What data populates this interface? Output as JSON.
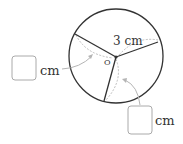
{
  "diagram": {
    "radius_label": "3 cm",
    "center_label": "O",
    "answer_boxes": [
      {
        "unit": "cm",
        "value": ""
      },
      {
        "unit": "cm",
        "value": ""
      }
    ],
    "colors": {
      "circle": "#333333",
      "guide": "#b5b5b5",
      "box_border": "#aaaaaa"
    }
  }
}
